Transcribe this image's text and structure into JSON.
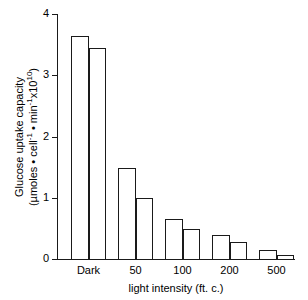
{
  "chart_data": {
    "type": "bar",
    "title": "",
    "categories": [
      "Dark",
      "50",
      "100",
      "200",
      "500"
    ],
    "series": [
      {
        "name": "bar-1",
        "values": [
          3.64,
          1.48,
          0.65,
          0.4,
          0.14
        ]
      },
      {
        "name": "bar-2",
        "values": [
          3.44,
          1.0,
          0.49,
          0.28,
          0.07
        ]
      }
    ],
    "xlabel": "light intensity (ft. c.)",
    "ylabel_line1": "Glucose uptake capacity",
    "ylabel_line2_prefix": "(µmoles • cell",
    "ylabel_line2_sup1": "-1",
    "ylabel_line2_mid": " • min",
    "ylabel_line2_sup2": "-1",
    "ylabel_line2_x": "x10",
    "ylabel_line2_sup3": "10",
    "ylabel_line2_suffix": ")",
    "ylim": [
      0,
      4
    ],
    "yticks": [
      "0",
      "1",
      "2",
      "3",
      "4"
    ],
    "ytick_values": [
      0,
      1,
      2,
      3,
      4
    ],
    "grid": false,
    "legend": "none",
    "bar_fill_color": "#ffffff",
    "bar_edge_color": "#1a1a1a",
    "axis_color": "#1a1a1a",
    "background_color": "#ffffff"
  }
}
